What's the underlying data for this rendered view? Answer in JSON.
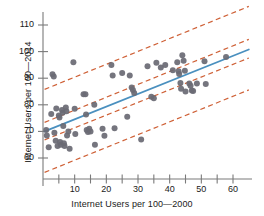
{
  "chart_data": {
    "type": "scatter",
    "title": "",
    "xlabel": "Internet Users per 100—2000",
    "ylabel": "Internet Users per 100—2014",
    "xlim": [
      0,
      66
    ],
    "ylim": [
      54,
      114
    ],
    "grid": false,
    "legend": null,
    "x_ticks_major": [
      10,
      20,
      30,
      40,
      50,
      60
    ],
    "x_tick_labels": [
      "10",
      "20",
      "30",
      "40",
      "50",
      "60"
    ],
    "x_ticks_minor": [
      5,
      15,
      25,
      35,
      45,
      55
    ],
    "y_ticks_major": [
      60,
      70,
      80,
      90,
      100,
      110
    ],
    "y_tick_labels": [
      "60",
      "70",
      "80",
      "90",
      "100",
      "110"
    ],
    "point_color": "#6b6b74",
    "point_size": 3.0,
    "fit_line": {
      "name": "least-squares regression line",
      "color": "#4a90bf",
      "x": [
        0.5,
        65
      ],
      "y": [
        70.0,
        100.8
      ]
    },
    "bands": {
      "name": "confidence and prediction bands",
      "color": "#cf6137",
      "style": "dashed",
      "lines": [
        {
          "label": "upper prediction band",
          "x": [
            0.5,
            65
          ],
          "y": [
            85.8,
            117.0
          ]
        },
        {
          "label": "upper confidence band",
          "x": [
            0.5,
            65
          ],
          "y": [
            73.4,
            104.6
          ]
        },
        {
          "label": "lower confidence band",
          "x": [
            0.5,
            65
          ],
          "y": [
            66.8,
            97.6
          ]
        },
        {
          "label": "lower prediction band",
          "x": [
            0.5,
            65
          ],
          "y": [
            54.6,
            85.6
          ]
        }
      ]
    },
    "points": [
      {
        "x": 1.0,
        "y": 70.5
      },
      {
        "x": 1.2,
        "y": 68.5
      },
      {
        "x": 1.8,
        "y": 64.0
      },
      {
        "x": 2.6,
        "y": 76.5
      },
      {
        "x": 3.0,
        "y": 91.5
      },
      {
        "x": 3.4,
        "y": 90.6
      },
      {
        "x": 3.6,
        "y": 69.5
      },
      {
        "x": 4.0,
        "y": 66.5
      },
      {
        "x": 4.2,
        "y": 78.6
      },
      {
        "x": 4.6,
        "y": 64.5
      },
      {
        "x": 5.0,
        "y": 76.0
      },
      {
        "x": 5.2,
        "y": 75.2
      },
      {
        "x": 5.4,
        "y": 66.0
      },
      {
        "x": 5.6,
        "y": 65.0
      },
      {
        "x": 6.0,
        "y": 78.0
      },
      {
        "x": 6.2,
        "y": 77.0
      },
      {
        "x": 6.4,
        "y": 72.0
      },
      {
        "x": 6.6,
        "y": 65.5
      },
      {
        "x": 6.8,
        "y": 64.5
      },
      {
        "x": 7.2,
        "y": 79.0
      },
      {
        "x": 7.4,
        "y": 77.6
      },
      {
        "x": 7.6,
        "y": 68.5
      },
      {
        "x": 8.0,
        "y": 70.0
      },
      {
        "x": 8.4,
        "y": 63.5
      },
      {
        "x": 9.6,
        "y": 96.0
      },
      {
        "x": 10.0,
        "y": 78.5
      },
      {
        "x": 10.2,
        "y": 69.0
      },
      {
        "x": 12.8,
        "y": 84.0
      },
      {
        "x": 13.4,
        "y": 84.0
      },
      {
        "x": 13.6,
        "y": 76.4
      },
      {
        "x": 13.8,
        "y": 70.5
      },
      {
        "x": 14.2,
        "y": 69.8
      },
      {
        "x": 14.6,
        "y": 71.0
      },
      {
        "x": 15.0,
        "y": 70.0
      },
      {
        "x": 16.2,
        "y": 80.0
      },
      {
        "x": 16.4,
        "y": 65.0
      },
      {
        "x": 18.8,
        "y": 71.0
      },
      {
        "x": 19.4,
        "y": 68.4
      },
      {
        "x": 21.6,
        "y": 95.0
      },
      {
        "x": 22.0,
        "y": 91.0
      },
      {
        "x": 22.6,
        "y": 71.2
      },
      {
        "x": 25.0,
        "y": 92.0
      },
      {
        "x": 26.6,
        "y": 75.5
      },
      {
        "x": 27.4,
        "y": 91.0
      },
      {
        "x": 28.0,
        "y": 86.5
      },
      {
        "x": 28.4,
        "y": 85.6
      },
      {
        "x": 28.8,
        "y": 84.4
      },
      {
        "x": 31.0,
        "y": 67.0
      },
      {
        "x": 33.0,
        "y": 94.5
      },
      {
        "x": 34.2,
        "y": 83.0
      },
      {
        "x": 35.0,
        "y": 82.5
      },
      {
        "x": 35.8,
        "y": 95.8
      },
      {
        "x": 37.2,
        "y": 94.0
      },
      {
        "x": 38.6,
        "y": 95.0
      },
      {
        "x": 41.0,
        "y": 93.0
      },
      {
        "x": 42.4,
        "y": 96.0
      },
      {
        "x": 42.8,
        "y": 92.6
      },
      {
        "x": 43.0,
        "y": 91.6
      },
      {
        "x": 43.4,
        "y": 88.2
      },
      {
        "x": 43.6,
        "y": 86.0
      },
      {
        "x": 44.0,
        "y": 98.6
      },
      {
        "x": 44.4,
        "y": 96.6
      },
      {
        "x": 44.8,
        "y": 92.8
      },
      {
        "x": 45.0,
        "y": 85.0
      },
      {
        "x": 46.2,
        "y": 88.0
      },
      {
        "x": 46.6,
        "y": 87.2
      },
      {
        "x": 47.0,
        "y": 85.4
      },
      {
        "x": 47.4,
        "y": 85.2
      },
      {
        "x": 48.6,
        "y": 88.0
      },
      {
        "x": 51.0,
        "y": 96.4
      },
      {
        "x": 51.4,
        "y": 87.8
      },
      {
        "x": 57.8,
        "y": 98.0
      }
    ]
  }
}
